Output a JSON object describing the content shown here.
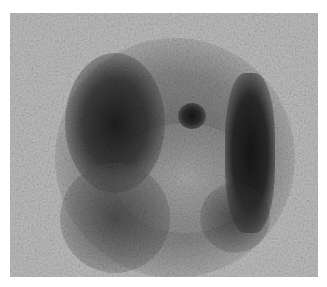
{
  "image": {
    "description": "Grayscale nuclear medicine scan (scintigraphy) showing a rounded mottled activity region with dark uptake areas at upper-left and a vertical dark band on the right, plus a small dark focal spot near center-top",
    "colors": {
      "background": "#b9b9b9",
      "dark_uptake": "#1e1e1e",
      "mid_tone": "#7a7a7a",
      "page": "#ffffff"
    }
  }
}
